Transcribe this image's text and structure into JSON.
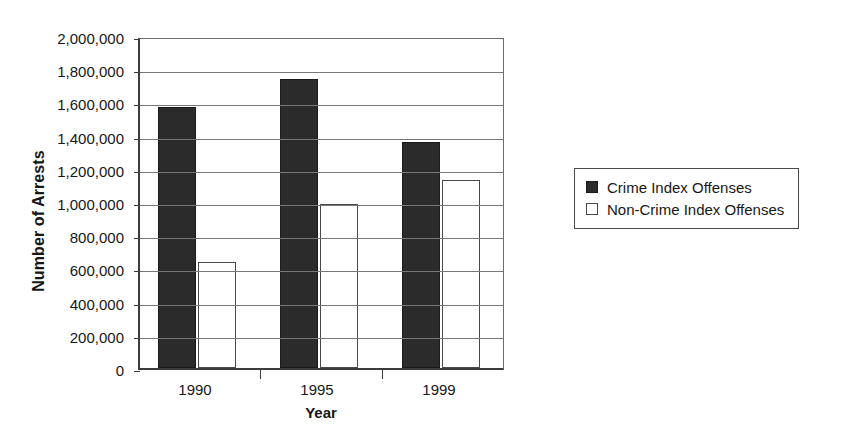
{
  "chart_data": {
    "type": "bar",
    "title": "",
    "xlabel": "Year",
    "ylabel": "Number of Arrests",
    "categories": [
      "1990",
      "1995",
      "1999"
    ],
    "series": [
      {
        "name": "Crime Index Offenses",
        "color": "#2b2b2b",
        "values": [
          1570000,
          1740000,
          1360000
        ]
      },
      {
        "name": "Non-Crime Index Offenses",
        "color": "#ffffff",
        "values": [
          640000,
          990000,
          1130000
        ]
      }
    ],
    "ylim": [
      0,
      2000000
    ],
    "ytick_values": [
      0,
      200000,
      400000,
      600000,
      800000,
      1000000,
      1200000,
      1400000,
      1600000,
      1800000,
      2000000
    ],
    "ytick_labels": [
      "0",
      "200,000",
      "400,000",
      "600,000",
      "800,000",
      "1,000,000",
      "1,200,000",
      "1,400,000",
      "1,600,000",
      "1,800,000",
      "2,000,000"
    ],
    "grid": true,
    "legend_position": "right"
  },
  "legend": {
    "items": [
      {
        "label": "Crime Index Offenses",
        "swatch": "filled-dark-square"
      },
      {
        "label": "Non-Crime Index Offenses",
        "swatch": "hollow-square"
      }
    ]
  }
}
